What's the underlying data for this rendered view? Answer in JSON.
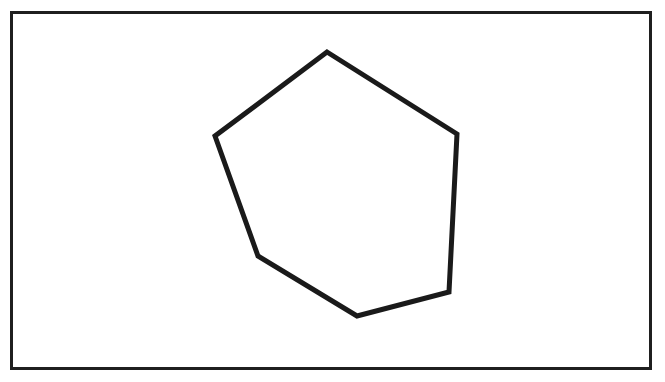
{
  "diagram": {
    "shape": "hexagon",
    "stroke_color": "#1a1a1a",
    "fill_color": "#ffffff",
    "stroke_width": 5,
    "vertices": [
      [
        327,
        52
      ],
      [
        457,
        134
      ],
      [
        449,
        292
      ],
      [
        357,
        316
      ],
      [
        258,
        256
      ],
      [
        215,
        136
      ]
    ]
  },
  "frame": {
    "border_color": "#1f1f1f"
  }
}
